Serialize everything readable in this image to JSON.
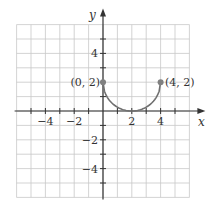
{
  "chart_data": {
    "type": "line",
    "title": "",
    "xlabel": "x",
    "ylabel": "y",
    "xlim": [
      -6,
      6
    ],
    "ylim": [
      -6,
      6
    ],
    "grid": true,
    "x_tick_labels": [
      "-4",
      "-2",
      "2",
      "4"
    ],
    "y_tick_labels": [
      "4",
      "-2",
      "-4"
    ],
    "series": [
      {
        "name": "lower semicircle centered (2,2) radius 2",
        "description": "y = 2 - sqrt(4 - (x-2)^2), 0 <= x <= 4",
        "x": [
          0,
          0.5,
          1,
          1.5,
          2,
          2.5,
          3,
          3.5,
          4
        ],
        "y": [
          2,
          0.68,
          0.27,
          0.06,
          0,
          0.06,
          0.27,
          0.68,
          2
        ]
      }
    ],
    "points": [
      {
        "x": 0,
        "y": 2,
        "label": "(0, 2)"
      },
      {
        "x": 4,
        "y": 2,
        "label": "(4, 2)"
      }
    ],
    "annotations": [
      "(0, 2)",
      "(4, 2)"
    ]
  },
  "labels": {
    "x_axis": "x",
    "y_axis": "y",
    "xticks": [
      {
        "value": -4,
        "text": "−4"
      },
      {
        "value": -2,
        "text": "−2"
      },
      {
        "value": 2,
        "text": "2"
      },
      {
        "value": 4,
        "text": "4"
      }
    ],
    "yticks": [
      {
        "value": 4,
        "text": "4"
      },
      {
        "value": -2,
        "text": "−2"
      },
      {
        "value": -4,
        "text": "−4"
      }
    ],
    "point_left": "(0, 2)",
    "point_right": "(4, 2)"
  },
  "colors": {
    "grid": "#c8c8c8",
    "axis": "#333333",
    "curve": "#707070",
    "point": "#808080"
  }
}
